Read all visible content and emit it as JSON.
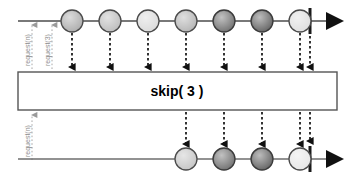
{
  "diagram": {
    "type": "rxjs-marble-diagram",
    "operator_box": {
      "label": "skip( 3 )",
      "x": 18,
      "y": 72,
      "width": 319,
      "height": 38,
      "border_color": "#555555",
      "fill_color": "#ffffff"
    },
    "backpressure_labels": [
      {
        "text": "request(n)",
        "x": 32,
        "y": 66,
        "section": "top"
      },
      {
        "text": "request(3)",
        "x": 52,
        "y": 66,
        "section": "top"
      },
      {
        "text": "request(n)",
        "x": 32,
        "y": 158,
        "section": "bottom"
      }
    ],
    "source_timeline": {
      "name": "source-observable",
      "y": 21,
      "x_start": 18,
      "x_end": 345,
      "line_color": "#4d4d4d",
      "terminator_x": 310,
      "terminator_label": "complete-bar",
      "arrowhead_x": 326,
      "items": [
        {
          "index": 1,
          "cx": 72,
          "fill": "#b0b0b0",
          "emits_to_output": false
        },
        {
          "index": 2,
          "cx": 110,
          "fill": "#c0c0c0",
          "emits_to_output": false
        },
        {
          "index": 3,
          "cx": 148,
          "fill": "#dcdcdc",
          "emits_to_output": false
        },
        {
          "index": 4,
          "cx": 186,
          "fill": "#b8b8b8",
          "emits_to_output": true
        },
        {
          "index": 5,
          "cx": 224,
          "fill": "#777777",
          "emits_to_output": true
        },
        {
          "index": 6,
          "cx": 262,
          "fill": "#6b6b6b",
          "emits_to_output": true
        },
        {
          "index": 7,
          "cx": 300,
          "fill": "#e0e0e0",
          "emits_to_output": true
        }
      ]
    },
    "result_timeline": {
      "name": "result-observable",
      "y": 159,
      "x_start": 18,
      "x_end": 345,
      "line_color": "#6e6e6e",
      "terminator_x": 310,
      "terminator_label": "complete-bar",
      "arrowhead_x": 326,
      "items": [
        {
          "index": 1,
          "cx": 186,
          "fill": "#c8c8c8"
        },
        {
          "index": 2,
          "cx": 224,
          "fill": "#777777"
        },
        {
          "index": 3,
          "cx": 262,
          "fill": "#6b6b6b"
        },
        {
          "index": 4,
          "cx": 300,
          "fill": "#e8e8e8"
        }
      ]
    },
    "input_arrows_x": [
      72,
      110,
      148,
      186,
      224,
      262,
      300,
      310
    ],
    "output_arrows_x": [
      186,
      224,
      262,
      300,
      310
    ],
    "circle_radius": 11,
    "colors": {
      "stroke": "#4a4a4a",
      "dashed_arrow": "#111111",
      "request_line": "#a8a8a8",
      "text": "#000000",
      "label_text": "#8d8d8d"
    }
  }
}
